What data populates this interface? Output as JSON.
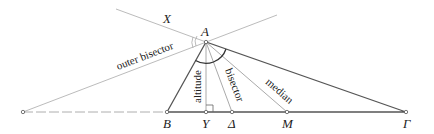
{
  "diagram": {
    "points": {
      "A": {
        "label": "A",
        "x": 206,
        "y": 42
      },
      "B": {
        "label": "B",
        "x": 167,
        "y": 112
      },
      "Y": {
        "label": "Y",
        "x": 206,
        "y": 112
      },
      "D": {
        "label": "Δ",
        "x": 232,
        "y": 112
      },
      "M": {
        "label": "M",
        "x": 287,
        "y": 112
      },
      "G": {
        "label": "Γ",
        "x": 406,
        "y": 112
      },
      "X": {
        "label": "X"
      },
      "P": {
        "x": 23,
        "y": 112
      }
    },
    "line_labels": {
      "outer_bisector": "outer bisector",
      "altitude": "altitude",
      "bisector": "bisector",
      "median": "median"
    },
    "colors": {
      "triangle": "#555555",
      "cevians": "#aaaaaa",
      "arc": "#333333"
    }
  }
}
